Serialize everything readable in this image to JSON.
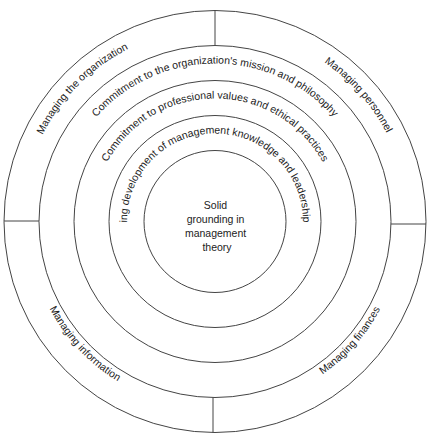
{
  "diagram": {
    "type": "concentric-circles",
    "center": {
      "label_lines": [
        "Solid",
        "grounding in",
        "management",
        "theory"
      ]
    },
    "rings": [
      {
        "label": "Ongoing development of management knowledge and leadership skills"
      },
      {
        "label": "Commitment to professional values and ethical practices"
      },
      {
        "label": "Commitment to the organization's mission and philosophy"
      }
    ],
    "outer_ring_segments": [
      {
        "label": "Managing the organization",
        "position": "top-left"
      },
      {
        "label": "Managing personnel",
        "position": "top-right"
      },
      {
        "label": "Managing finances",
        "position": "bottom-right"
      },
      {
        "label": "Managing information",
        "position": "bottom-left"
      }
    ],
    "colors": {
      "stroke": "#444444",
      "text": "#222222",
      "background": "#ffffff"
    }
  }
}
